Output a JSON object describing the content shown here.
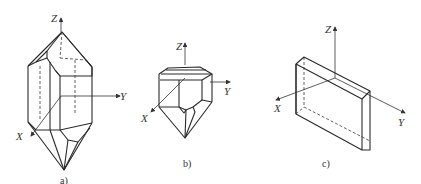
{
  "figure": {
    "panels": [
      {
        "id": "a",
        "caption": "a)",
        "subject": "quartz crystal (hexagonal prism with pyramidal terminations)",
        "axes": {
          "z": "Z",
          "y": "Y",
          "x": "X"
        }
      },
      {
        "id": "b",
        "caption": "b)",
        "subject": "quartz crystal fragment (truncated, one termination)",
        "axes": {
          "z": "Z",
          "y": "Y",
          "x": "X"
        }
      },
      {
        "id": "c",
        "caption": "c)",
        "subject": "rectangular crystal plate / wafer",
        "axes": {
          "z": "Z",
          "y": "Y",
          "x": "X"
        }
      }
    ]
  }
}
